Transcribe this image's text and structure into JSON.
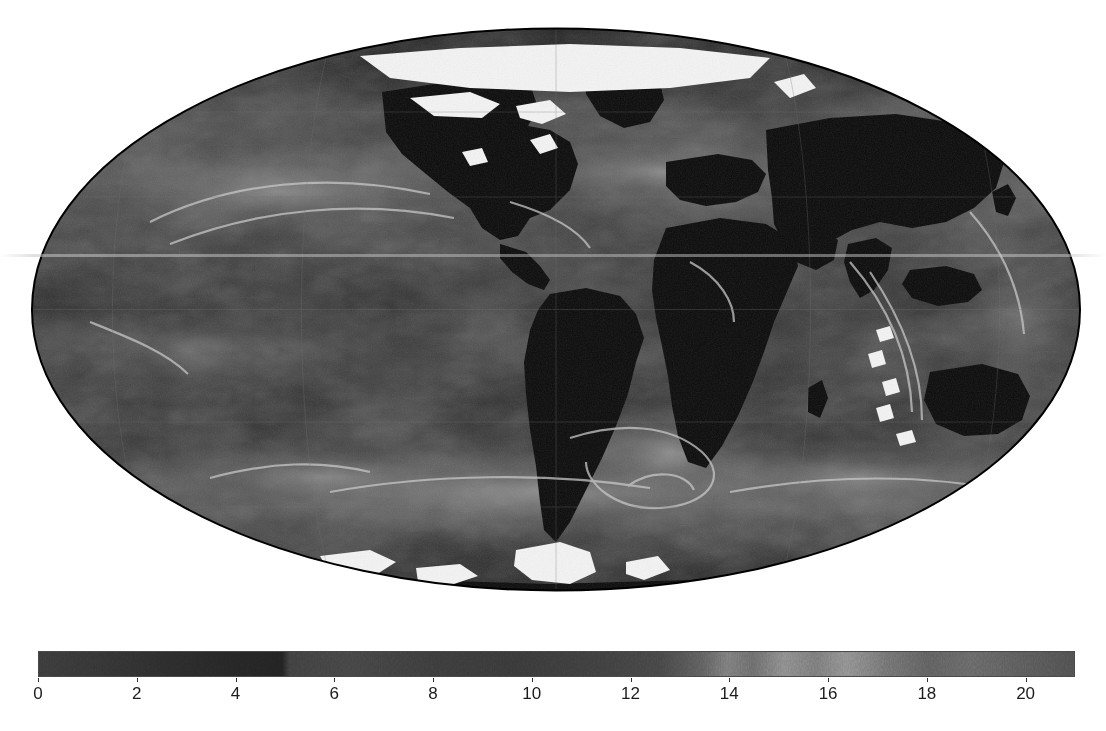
{
  "figure": {
    "background_color": "#ffffff",
    "map_projection": "mollweide",
    "rendering": "grayscale raster, scanned figure"
  },
  "map": {
    "name": "global-mollweide-map",
    "outline_color": "#000000",
    "land_color": "#0d0d0d",
    "ocean_mid_color": "#3b3b3b",
    "nodata_color": "#f2f2f2",
    "has_equator_gridline": true,
    "has_meridian_gridlines": true,
    "gridline_color": "#707070"
  },
  "chart_data": {
    "type": "heatmap",
    "title": "",
    "subtitle": "",
    "xlabel": "",
    "ylabel": "",
    "projection": "Mollweide (global equal-area)",
    "colormap": "grayscale",
    "colorbar": {
      "orientation": "horizontal",
      "vmin": 0,
      "vmax": 21,
      "tick_values": [
        0,
        2,
        4,
        6,
        8,
        10,
        12,
        14,
        16,
        18,
        20
      ],
      "tick_labels": [
        "0",
        "2",
        "4",
        "6",
        "8",
        "10",
        "12",
        "14",
        "16",
        "18",
        "20"
      ],
      "tick_step": 2,
      "label": ""
    },
    "gridlines": {
      "latitudes": [
        -60,
        -30,
        0,
        30,
        60
      ],
      "longitudes": [
        -120,
        -60,
        0,
        60,
        120
      ],
      "grid_on": true
    },
    "value_range_note": "field values span 0 to about 21 in colorbar units",
    "legend_position": "bottom"
  },
  "colorbar": {
    "name": "horizontal-colorbar",
    "ticks": [
      {
        "value": 0,
        "label": "0"
      },
      {
        "value": 2,
        "label": "2"
      },
      {
        "value": 4,
        "label": "4"
      },
      {
        "value": 6,
        "label": "6"
      },
      {
        "value": 8,
        "label": "8"
      },
      {
        "value": 10,
        "label": "10"
      },
      {
        "value": 12,
        "label": "12"
      },
      {
        "value": 14,
        "label": "14"
      },
      {
        "value": 16,
        "label": "16"
      },
      {
        "value": 18,
        "label": "18"
      },
      {
        "value": 20,
        "label": "20"
      }
    ],
    "min": 0,
    "max": 21,
    "low_color": "#2a2a2a",
    "mid_color": "#3c3c3c",
    "high_color": "#6e6e6e"
  }
}
